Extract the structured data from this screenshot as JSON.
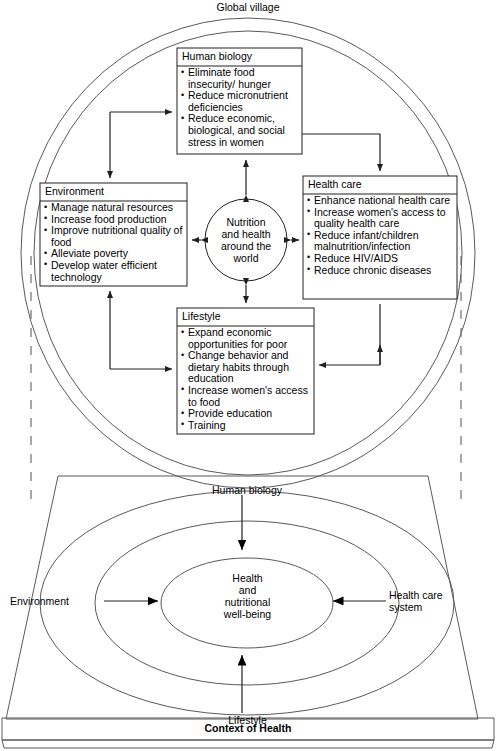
{
  "figure": {
    "top_label": "Global village",
    "bottom_bar_label": "Context of Health",
    "hub_label": "Nutrition\nand health\naround the\nworld"
  },
  "top_diagram": {
    "title": "Global village",
    "center_node": {
      "name": "nutrition-hub",
      "label_lines": [
        "Nutrition",
        "and health",
        "around the",
        "world"
      ]
    },
    "boxes": [
      {
        "id": "human-biology",
        "title": "Human biology",
        "items": [
          "Eliminate food insecurity/ hunger",
          "Reduce micronutrient deficiencies",
          "Reduce economic, biological, and social stress in women"
        ]
      },
      {
        "id": "environment",
        "title": "Environment",
        "items": [
          "Manage natural resources",
          "Increase food production",
          "Improve nutritional quality of food",
          "Alleviate poverty",
          "Develop water efficient technology"
        ]
      },
      {
        "id": "health-care",
        "title": "Health care",
        "items": [
          "Enhance national health care",
          "Increase women's access to quality health care",
          "Reduce infant/children malnutrition/infection",
          "Reduce HIV/AIDS",
          "Reduce chronic diseases"
        ]
      },
      {
        "id": "lifestyle",
        "title": "Lifestyle",
        "items": [
          "Expand economic opportunities for poor",
          "Change behavior and dietary habits through education",
          "Increase women's access to food",
          "Provide education",
          "Training"
        ]
      }
    ]
  },
  "bottom_diagram": {
    "center_label_lines": [
      "Health",
      "and",
      "nutritional",
      "well-being"
    ],
    "determinants": [
      {
        "id": "human-biology",
        "label": "Human biology",
        "position": "top",
        "arrow": "down"
      },
      {
        "id": "environment",
        "label": "Environment",
        "position": "left",
        "arrow": "right"
      },
      {
        "id": "health-care-system",
        "label": "Health care\nsystem",
        "position": "right",
        "arrow": "left"
      },
      {
        "id": "lifestyle",
        "label": "Lifestyle",
        "position": "bottom",
        "arrow": "up"
      }
    ],
    "context_bar": "Context of Health"
  },
  "colors": {
    "stroke": "#231f20",
    "stroke_light": "#58595b",
    "dashed": "#6d6e71",
    "background": "#ffffff"
  }
}
